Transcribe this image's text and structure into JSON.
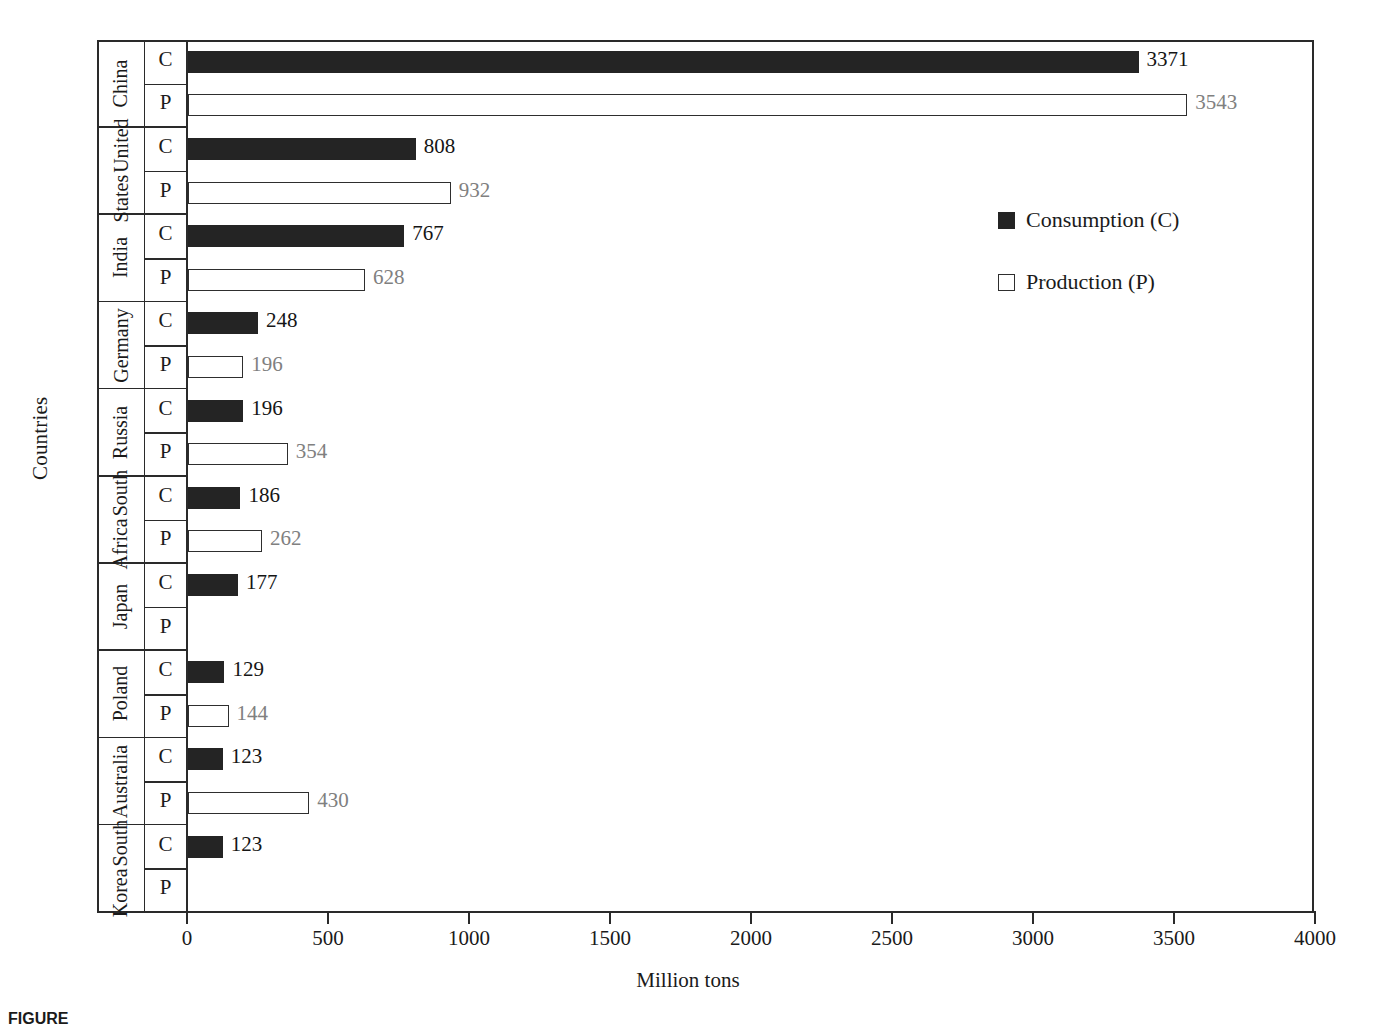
{
  "chart_data": {
    "type": "bar",
    "orientation": "horizontal",
    "title": "",
    "xlabel": "Million tons",
    "ylabel": "Countries",
    "xlim": [
      0,
      4000
    ],
    "xticks": [
      0,
      500,
      1000,
      1500,
      2000,
      2500,
      3000,
      3500,
      4000
    ],
    "grid": false,
    "legend_position": "right",
    "categories": [
      "China",
      "United States",
      "India",
      "Germany",
      "Russia",
      "South Africa",
      "Japan",
      "Poland",
      "Australia",
      "South Korea"
    ],
    "series": [
      {
        "name": "Consumption (C)",
        "key": "C",
        "color": "#242424",
        "values": [
          3371,
          808,
          767,
          248,
          196,
          186,
          177,
          129,
          123,
          123
        ]
      },
      {
        "name": "Production (P)",
        "key": "P",
        "color": "#ffffff",
        "values": [
          3543,
          932,
          628,
          196,
          354,
          262,
          null,
          144,
          430,
          null
        ]
      }
    ],
    "rows": [
      {
        "country": "China",
        "country_lines": [
          "China"
        ],
        "c": 3371,
        "c_label": "3371",
        "p": 3543,
        "p_label": "3543"
      },
      {
        "country": "United States",
        "country_lines": [
          "United",
          "States"
        ],
        "c": 808,
        "c_label": "808",
        "p": 932,
        "p_label": "932"
      },
      {
        "country": "India",
        "country_lines": [
          "India"
        ],
        "c": 767,
        "c_label": "767",
        "p": 628,
        "p_label": "628"
      },
      {
        "country": "Germany",
        "country_lines": [
          "Germany"
        ],
        "c": 248,
        "c_label": "248",
        "p": 196,
        "p_label": "196"
      },
      {
        "country": "Russia",
        "country_lines": [
          "Russia"
        ],
        "c": 196,
        "c_label": "196",
        "p": 354,
        "p_label": "354"
      },
      {
        "country": "South Africa",
        "country_lines": [
          "South",
          "Africa"
        ],
        "c": 186,
        "c_label": "186",
        "p": 262,
        "p_label": "262"
      },
      {
        "country": "Japan",
        "country_lines": [
          "Japan"
        ],
        "c": 177,
        "c_label": "177",
        "p": null,
        "p_label": ""
      },
      {
        "country": "Poland",
        "country_lines": [
          "Poland"
        ],
        "c": 129,
        "c_label": "129",
        "p": 144,
        "p_label": "144"
      },
      {
        "country": "Australia",
        "country_lines": [
          "Australia"
        ],
        "c": 123,
        "c_label": "123",
        "p": 430,
        "p_label": "430"
      },
      {
        "country": "South Korea",
        "country_lines": [
          "South",
          "Korea"
        ],
        "c": 123,
        "c_label": "123",
        "p": null,
        "p_label": ""
      }
    ],
    "row_letters": {
      "consumption": "C",
      "production": "P"
    }
  },
  "axes": {
    "ylabel": "Countries",
    "xlabel": "Million tons",
    "xticklabels": [
      "0",
      "500",
      "1000",
      "1500",
      "2000",
      "2500",
      "3000",
      "3500",
      "4000"
    ]
  },
  "legend": {
    "items": [
      {
        "label": "Consumption (C)",
        "swatch": "filled-square-icon"
      },
      {
        "label": "Production (P)",
        "swatch": "hollow-square-icon"
      }
    ]
  },
  "caption": {
    "prefix": "FIGURE",
    "text": ""
  },
  "colors": {
    "consumption_fill": "#242424",
    "production_fill": "#ffffff",
    "production_stroke": "#2e2e2e",
    "axis": "#2a2a2a",
    "consumption_label": "#151515",
    "production_label": "#808080"
  }
}
